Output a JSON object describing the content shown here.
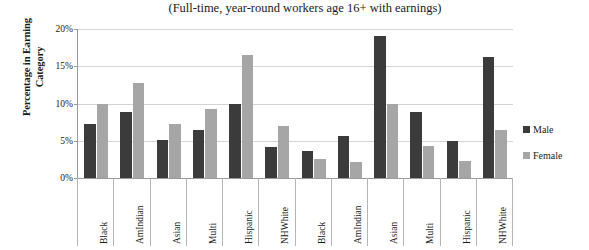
{
  "chart_data": {
    "type": "bar",
    "title": "(Full-time, year-round workers age 16+ with earnings)",
    "xlabel": "",
    "ylabel": "Percentage in Earning Category",
    "ylabel_line1": "Percentage in Earning",
    "ylabel_line2": "Category",
    "ylim": [
      0,
      20
    ],
    "ytick_labels": [
      "20%",
      "15%",
      "10%",
      "5%",
      "0%"
    ],
    "ytick_values": [
      20,
      15,
      10,
      5,
      0
    ],
    "grid": true,
    "legend_position": "right",
    "categories": [
      "Black",
      "AmIndian",
      "Asian",
      "Multi",
      "Hispanic",
      "NHWhite",
      "Black",
      "AmIndian",
      "Asian",
      "Multi",
      "Hispanic",
      "NHWhite"
    ],
    "series": [
      {
        "name": "Male",
        "color": "#3b3b3b",
        "values": [
          7.3,
          8.8,
          5.1,
          6.4,
          10.0,
          4.2,
          3.6,
          5.6,
          19.0,
          8.9,
          5.0,
          16.2
        ]
      },
      {
        "name": "Female",
        "color": "#a6a6a6",
        "values": [
          10.0,
          12.8,
          7.2,
          9.3,
          16.5,
          7.0,
          2.6,
          2.2,
          10.0,
          4.3,
          2.3,
          6.4
        ]
      }
    ]
  },
  "legend": {
    "items": [
      {
        "label": "Male",
        "swatch": "male"
      },
      {
        "label": "Female",
        "swatch": "female"
      }
    ]
  }
}
